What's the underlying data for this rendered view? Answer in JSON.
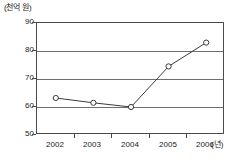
{
  "chart_data": {
    "type": "line",
    "title": "",
    "subtitle": "",
    "xlabel": "(년)",
    "ylabel": "(천억 원)",
    "categories": [
      "2002",
      "2003",
      "2004",
      "2005",
      "2006"
    ],
    "values": [
      63.2,
      61.5,
      60.0,
      74.5,
      83.0
    ],
    "series": [
      {
        "name": "",
        "values": [
          63.2,
          61.5,
          60.0,
          74.5,
          83.0
        ]
      }
    ],
    "ylim": [
      50,
      90
    ],
    "y_ticks": [
      50,
      60,
      70,
      80,
      90
    ],
    "y_tick_labels": [
      "50",
      "60",
      "70",
      "80",
      "90"
    ],
    "x_tick_labels": [
      "2002",
      "2003",
      "2004",
      "2005",
      "2006"
    ],
    "grid": true,
    "grid_axis": "y",
    "legend": false,
    "legend_position": "none",
    "marker": "open-circle",
    "line_color": "#3b3b3b",
    "grid_color": "#6e6e6e",
    "frame_color": "#4a4a4a",
    "marker_fill": "#ffffff",
    "background": "#ffffff"
  },
  "axes": {
    "y_unit_label": "(천억 원)",
    "x_unit_label": "(년)"
  }
}
